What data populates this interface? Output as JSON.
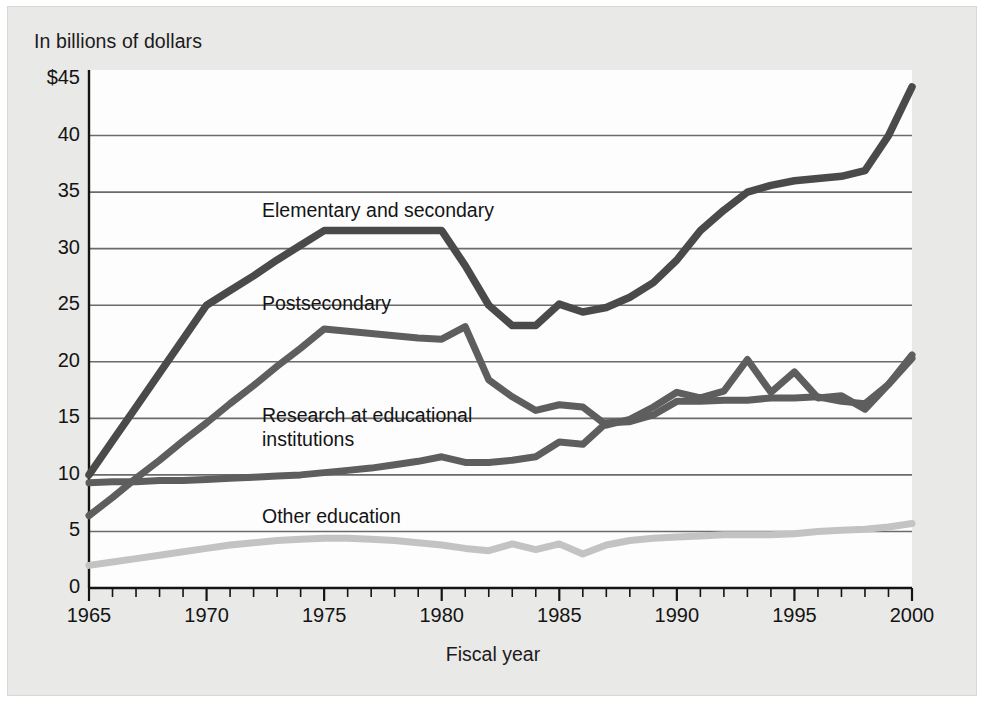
{
  "figure": {
    "unit_note": "In billions of dollars",
    "x_axis_title": "Fiscal year"
  },
  "series_labels": {
    "elementary": "Elementary and secondary",
    "postsecondary": "Postsecondary",
    "research": "Research at educational\ninstitutions",
    "other": "Other education"
  },
  "chart_data": {
    "type": "line",
    "title": "",
    "subtitle": "",
    "xlabel": "Fiscal year",
    "ylabel": "In billions of dollars",
    "xlim": [
      1965,
      2000
    ],
    "ylim": [
      0,
      45
    ],
    "yticks": [
      "0",
      "5",
      "10",
      "15",
      "20",
      "25",
      "30",
      "35",
      "40",
      "$45"
    ],
    "ytick_values": [
      0,
      5,
      10,
      15,
      20,
      25,
      30,
      35,
      40,
      45
    ],
    "xticks": [
      "1965",
      "1970",
      "1975",
      "1980",
      "1985",
      "1990",
      "1995",
      "2000"
    ],
    "xtick_values": [
      1965,
      1970,
      1975,
      1980,
      1985,
      1990,
      1995,
      2000
    ],
    "minor_xticks": "annual",
    "grid": "horizontal",
    "legend": "inline-labels",
    "x": [
      1965,
      1966,
      1967,
      1968,
      1969,
      1970,
      1971,
      1972,
      1973,
      1974,
      1975,
      1976,
      1977,
      1978,
      1979,
      1980,
      1981,
      1982,
      1983,
      1984,
      1985,
      1986,
      1987,
      1988,
      1989,
      1990,
      1991,
      1992,
      1993,
      1994,
      1995,
      1996,
      1997,
      1998,
      1999,
      2000
    ],
    "series": [
      {
        "name": "Elementary and secondary",
        "color": "#4a4a4a",
        "width": 7.5,
        "values": [
          10.0,
          13.0,
          16.0,
          19.0,
          22.0,
          25.0,
          26.3,
          27.6,
          29.0,
          30.3,
          31.6,
          31.6,
          31.6,
          31.6,
          31.6,
          31.6,
          28.5,
          25.0,
          23.2,
          23.2,
          25.1,
          24.4,
          24.8,
          25.7,
          27.0,
          29.0,
          31.6,
          33.4,
          35.0,
          35.6,
          36.0,
          36.2,
          36.4,
          36.9,
          40.0,
          44.3
        ]
      },
      {
        "name": "Postsecondary",
        "color": "#5e5e5e",
        "width": 7.0,
        "values": [
          6.4,
          8.0,
          9.7,
          11.3,
          13.0,
          14.6,
          16.3,
          17.9,
          19.6,
          21.2,
          22.9,
          22.7,
          22.5,
          22.3,
          22.1,
          22.0,
          23.1,
          18.4,
          16.9,
          15.7,
          16.2,
          16.0,
          14.4,
          14.9,
          16.0,
          17.3,
          16.8,
          17.4,
          20.2,
          17.3,
          19.1,
          16.8,
          17.0,
          15.8,
          18.0,
          20.6
        ]
      },
      {
        "name": "Research at educational institutions",
        "color": "#5e5e5e",
        "width": 7.0,
        "values": [
          9.3,
          9.4,
          9.4,
          9.5,
          9.5,
          9.6,
          9.7,
          9.8,
          9.9,
          10.0,
          10.2,
          10.4,
          10.6,
          10.9,
          11.2,
          11.6,
          11.1,
          11.1,
          11.3,
          11.6,
          12.9,
          12.7,
          14.6,
          14.7,
          15.3,
          16.5,
          16.5,
          16.6,
          16.6,
          16.8,
          16.8,
          16.9,
          16.5,
          16.3,
          18.0,
          20.3
        ]
      },
      {
        "name": "Other education",
        "color": "#c3c3c3",
        "width": 7.0,
        "values": [
          2.0,
          2.3,
          2.6,
          2.9,
          3.2,
          3.5,
          3.8,
          4.0,
          4.2,
          4.3,
          4.4,
          4.4,
          4.3,
          4.2,
          4.0,
          3.8,
          3.5,
          3.3,
          3.9,
          3.4,
          3.9,
          3.0,
          3.8,
          4.2,
          4.4,
          4.5,
          4.6,
          4.7,
          4.7,
          4.7,
          4.8,
          5.0,
          5.1,
          5.2,
          5.4,
          5.7
        ]
      }
    ]
  },
  "style": {
    "panel_bg": "#e9e9e7",
    "plot_bg": "#fdfdfd",
    "gridline_color": "#6b6b6b",
    "text_color": "#141414"
  }
}
